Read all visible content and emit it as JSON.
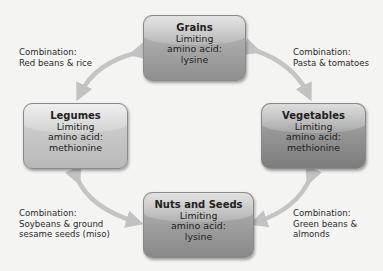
{
  "nodes": {
    "grains": {
      "title": "Grains",
      "line1": "Limiting",
      "line2": "amino acid:",
      "line3": "lysine",
      "color": "#a8a8a8"
    },
    "legumes": {
      "title": "Legumes",
      "line1": "Limiting",
      "line2": "amino acid:",
      "line3": "methionine",
      "color": "#c8c8c8"
    },
    "vegetables": {
      "title": "Vegetables",
      "line1": "Limiting",
      "line2": "amino acid:",
      "line3": "methionine",
      "color": "#969696"
    },
    "nuts_seeds": {
      "title": "Nuts and Seeds",
      "line1": "Limiting",
      "line2": "amino acid:",
      "line3": "lysine",
      "color": "#a2a2a2"
    }
  },
  "combinations": {
    "grains_legumes": {
      "line1": "Combination:",
      "line2": "Red beans & rice"
    },
    "grains_vegetables": {
      "line1": "Combination:",
      "line2": "Pasta & tomatoes"
    },
    "legumes_nuts": {
      "line1": "Combination:",
      "line2": "Soybeans & ground",
      "line3": "sesame seeds (miso)"
    },
    "vegetables_nuts": {
      "line1": "Combination:",
      "line2": "Green beans &",
      "line3": "almonds"
    }
  },
  "edges": [
    {
      "from": "grains",
      "to": "legumes",
      "style": "double-arrow"
    },
    {
      "from": "grains",
      "to": "vegetables",
      "style": "double-arrow"
    },
    {
      "from": "legumes",
      "to": "nuts_seeds",
      "style": "double-arrow"
    },
    {
      "from": "vegetables",
      "to": "nuts_seeds",
      "style": "double-arrow"
    }
  ],
  "arrow_color": "#c4c4c4"
}
